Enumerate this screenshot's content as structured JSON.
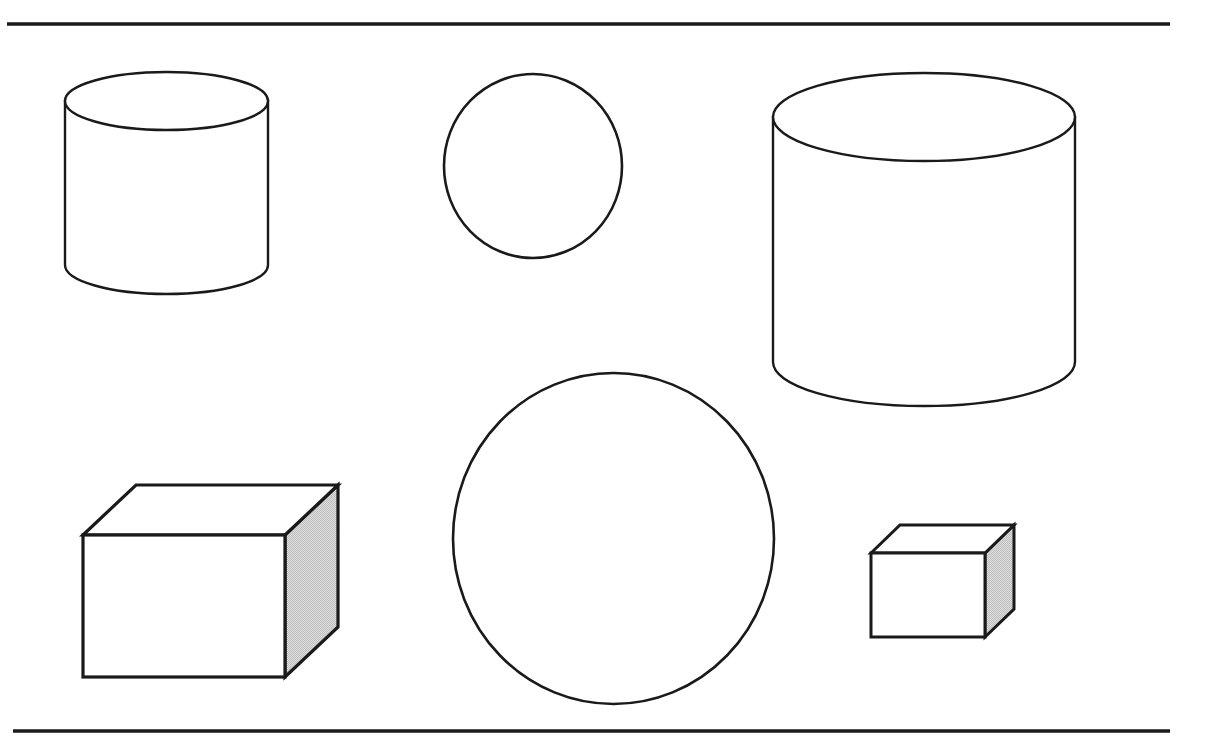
{
  "figure": {
    "background_color": "#ffffff",
    "stroke_color": "#1a1a1a",
    "shade_color": "#d4d4d4",
    "canvas": {
      "width": 1211,
      "height": 739
    }
  },
  "rules": [
    {
      "name": "top-rule",
      "label": "Top horizontal rule",
      "x1": 7,
      "y1": 24,
      "x2": 1170,
      "y2": 24,
      "thickness": 3.5
    },
    {
      "name": "bottom-rule",
      "label": "Bottom horizontal rule",
      "x1": 13,
      "y1": 731,
      "x2": 1170,
      "y2": 731,
      "thickness": 3.5
    }
  ],
  "shapes": [
    {
      "id": "small-cylinder",
      "type": "cylinder",
      "label": "Small cylinder",
      "position": "top-left",
      "cx": 166.5,
      "cy_top": 101,
      "rx": 101.5,
      "ry": 29,
      "body_height": 164,
      "bottom_cy": 265,
      "stroke_width": 2.4
    },
    {
      "id": "small-circle",
      "type": "circle",
      "label": "Small circle",
      "position": "top-center",
      "cx": 533,
      "cy": 166,
      "rx": 89,
      "ry": 92,
      "stroke_width": 2.6
    },
    {
      "id": "large-cylinder",
      "type": "cylinder",
      "label": "Large cylinder",
      "position": "top-right",
      "cx": 924,
      "cy_top": 117,
      "rx": 151,
      "ry": 44,
      "body_height": 245,
      "bottom_cy": 362,
      "stroke_width": 2.4
    },
    {
      "id": "large-cube",
      "type": "cube",
      "label": "Large cube with shaded right face",
      "position": "bottom-left",
      "front_left": 83,
      "front_right": 285,
      "front_top": 535,
      "front_bottom": 677,
      "depth_dx": 53,
      "depth_dy": -50,
      "stroke_width": 3.2,
      "shaded": true
    },
    {
      "id": "large-circle",
      "type": "circle",
      "label": "Large circle",
      "position": "bottom-center",
      "cx": 613.5,
      "cy": 538.5,
      "rx": 160.5,
      "ry": 165.5,
      "stroke_width": 2.6
    },
    {
      "id": "small-cube",
      "type": "cube",
      "label": "Small cube with shaded right face",
      "position": "bottom-right",
      "front_left": 871,
      "front_right": 985,
      "front_top": 553,
      "front_bottom": 637,
      "depth_dx": 29,
      "depth_dy": -28,
      "stroke_width": 3.0,
      "shaded": true
    }
  ]
}
